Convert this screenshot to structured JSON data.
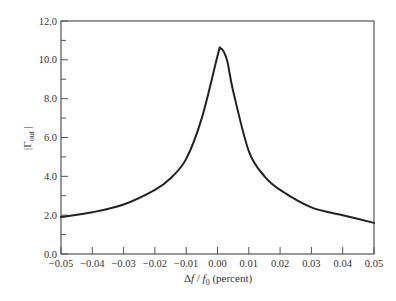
{
  "chart_data": {
    "type": "line",
    "title": "",
    "xlabel": "Δf / f0 (percent)",
    "ylabel": "|Γout|",
    "xlim": [
      -0.05,
      0.05
    ],
    "ylim": [
      0.0,
      12.0
    ],
    "grid": false,
    "legend": null,
    "x_ticks": [
      "-0.05",
      "-0.04",
      "-0.03",
      "-0.02",
      "-0.01",
      "0.00",
      "0.01",
      "0.02",
      "0.03",
      "0.04",
      "0.05"
    ],
    "y_ticks": [
      "0.0",
      "2.0",
      "4.0",
      "6.0",
      "8.0",
      "10.0",
      "12.0"
    ],
    "series": [
      {
        "name": "|Γout|",
        "x": [
          -0.05,
          -0.04,
          -0.03,
          -0.02,
          -0.015,
          -0.01,
          -0.005,
          0.0,
          0.001,
          0.003,
          0.005,
          0.01,
          0.015,
          0.02,
          0.03,
          0.04,
          0.05
        ],
        "values": [
          1.9,
          2.15,
          2.55,
          3.3,
          3.9,
          4.9,
          7.0,
          10.2,
          10.6,
          10.0,
          8.4,
          5.3,
          4.0,
          3.3,
          2.4,
          2.0,
          1.6
        ]
      }
    ]
  },
  "labels": {
    "ylabel_main": "|Γ",
    "ylabel_sub": "out",
    "ylabel_end": " |",
    "xlabel_delta": "Δ",
    "xlabel_f": "f",
    "xlabel_slash": " / ",
    "xlabel_f0": "f",
    "xlabel_f0_sub": "0",
    "xlabel_unit": " (percent)"
  }
}
